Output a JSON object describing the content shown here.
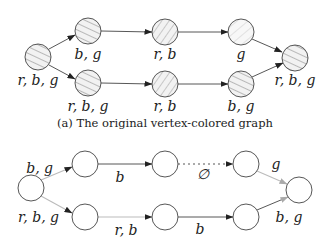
{
  "figure": {
    "graph_a": {
      "caption": "(a)  The original vertex-colored graph",
      "nodes": [
        {
          "id": "s",
          "label": "r, b, g",
          "hatch": "desc"
        },
        {
          "id": "t1",
          "label": "b, g",
          "hatch": "desc"
        },
        {
          "id": "t2",
          "label": "r, b",
          "hatch": "asc"
        },
        {
          "id": "t3",
          "label": "g",
          "hatch": "light"
        },
        {
          "id": "b1",
          "label": "r, b, g",
          "hatch": "desc"
        },
        {
          "id": "b2",
          "label": "r, b",
          "hatch": "asc"
        },
        {
          "id": "b3",
          "label": "b, g",
          "hatch": "desc"
        },
        {
          "id": "e",
          "label": "r, b, g",
          "hatch": "desc"
        }
      ]
    },
    "graph_b": {
      "edge_labels": {
        "s_t1": "b, g",
        "s_b1": "r, b, g",
        "t1_t2": "b",
        "t2_t3": "∅",
        "t3_e": "g",
        "b1_b2": "r, b",
        "b2_b3": "b",
        "b3_e": "b, g"
      }
    }
  }
}
